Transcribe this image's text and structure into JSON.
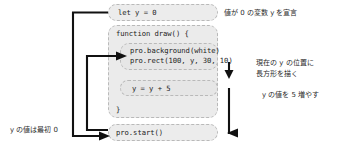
{
  "diagram": {
    "blocks": {
      "let_y": "let y = 0",
      "function_draw": "function draw() {",
      "draw_body_line1": "pro.background(white)",
      "draw_body_line2": "pro.rect(100, y, 30, 10)",
      "increment": "y = y + 5",
      "closing_brace": "}",
      "pro_start": "pro.start()"
    },
    "annotations": {
      "declare": "値が 0 の変数 y を宣言",
      "draw_rect_line1": "現在の y の位置に",
      "draw_rect_line2": "長方形を描く",
      "increase": "y の値を 5 増やす",
      "initial_value": "y の値は最初 0"
    },
    "colors": {
      "box_fill": "#ececec",
      "box_border": "#b9b9b9",
      "arrow": "#111111",
      "text": "#1c1c1c",
      "background": "#ffffff"
    }
  }
}
